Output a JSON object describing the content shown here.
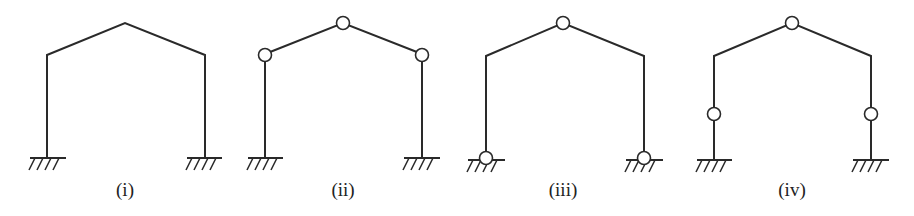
{
  "frames": [
    {
      "id": "i",
      "label": "(i)",
      "left_x": 47,
      "right_x": 205,
      "eave_y": 55,
      "apex": [
        125,
        23
      ],
      "base_y": 158,
      "hinges": [],
      "base_type": "fixed"
    },
    {
      "id": "ii",
      "label": "(ii)",
      "left_x": 265,
      "right_x": 422,
      "eave_y": 54,
      "apex": [
        343,
        23
      ],
      "base_y": 158,
      "hinges": [
        "apex",
        "left-eave",
        "right-eave"
      ],
      "base_type": "fixed"
    },
    {
      "id": "iii",
      "label": "(iii)",
      "left_x": 486,
      "right_x": 644,
      "eave_y": 56,
      "apex": [
        563,
        23
      ],
      "base_y": 158,
      "hinges": [
        "apex"
      ],
      "base_type": "pinned"
    },
    {
      "id": "iv",
      "label": "(iv)",
      "left_x": 714,
      "right_x": 871,
      "eave_y": 56,
      "apex": [
        792,
        23
      ],
      "base_y": 160,
      "hinges": [
        "apex",
        "left-column-mid",
        "right-column-mid"
      ],
      "base_type": "fixed"
    }
  ],
  "colors": {
    "line": "#2a2a2a",
    "background": "#ffffff"
  }
}
